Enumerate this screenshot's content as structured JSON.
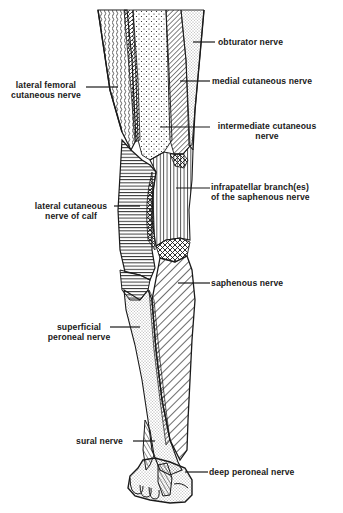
{
  "figure": {
    "colors": {
      "ink": "#1a1a1a",
      "background": "#ffffff"
    }
  },
  "labels": {
    "obturator": {
      "text": "obturator nerve"
    },
    "lateral_femoral": {
      "line1": "lateral femoral",
      "line2": "cutaneous nerve"
    },
    "medial_cutaneous": {
      "text": "medial cutaneous nerve"
    },
    "intermediate_cutaneous": {
      "line1": "intermediate cutaneous",
      "line2": "nerve"
    },
    "infrapatellar": {
      "line1": "infrapatellar branch(es)",
      "line2": "of the saphenous nerve"
    },
    "lateral_calf": {
      "line1": "lateral cutaneous",
      "line2": "nerve of calf"
    },
    "saphenous": {
      "text": "saphenous nerve"
    },
    "superficial_peroneal": {
      "line1": "superficial",
      "line2": "peroneal nerve"
    },
    "sural": {
      "text": "sural nerve"
    },
    "deep_peroneal": {
      "text": "deep peroneal nerve"
    }
  }
}
